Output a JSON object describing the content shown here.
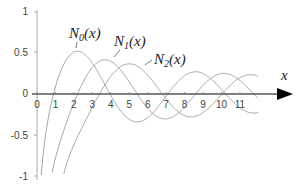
{
  "chart_data": {
    "type": "line",
    "title": "",
    "xlabel": "x",
    "ylabel": "",
    "xlim": [
      0,
      13
    ],
    "ylim": [
      -1,
      1
    ],
    "x_ticks": [
      "0",
      "1",
      "2",
      "3",
      "4",
      "5",
      "6",
      "7",
      "8",
      "9",
      "10",
      "11"
    ],
    "y_ticks": [
      "1",
      "0.5",
      "0",
      "-0.5",
      "-1"
    ],
    "grid": false,
    "legend": "inline annotations",
    "series": [
      {
        "name": "N0(x)",
        "description": "Bessel function of the second kind, order 0",
        "peak": [
          2.0,
          0.52
        ]
      },
      {
        "name": "N1(x)",
        "description": "Bessel function of the second kind, order 1",
        "peak": [
          3.7,
          0.42
        ]
      },
      {
        "name": "N2(x)",
        "description": "Bessel function of the second kind, order 2",
        "peak": [
          5.0,
          0.37
        ]
      }
    ]
  },
  "labels": {
    "n0": {
      "base": "N",
      "sub": "0",
      "arg": "(x)"
    },
    "n1": {
      "base": "N",
      "sub": "1",
      "arg": "(x)"
    },
    "n2": {
      "base": "N",
      "sub": "2",
      "arg": "(x)"
    },
    "x_axis": "x"
  },
  "colors": {
    "curve": "#999999",
    "axis": "#555555",
    "arrow": "#000000"
  }
}
